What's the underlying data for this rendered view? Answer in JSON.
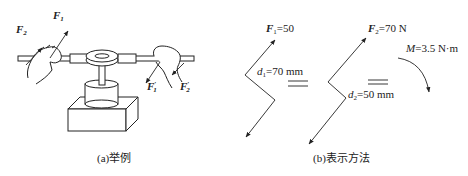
{
  "figure": {
    "panel_a": {
      "caption": "(a)举例",
      "labels": {
        "f1": "F",
        "f1_sub": "1",
        "f2": "F",
        "f2_sub": "2",
        "f1_prime": "F",
        "f1_prime_sub": "1",
        "f1_prime_mark": "′",
        "f2_prime": "F",
        "f2_prime_sub": "2",
        "f2_prime_mark": "′"
      }
    },
    "panel_b": {
      "caption": "(b)表示方法",
      "couple1": {
        "force_symbol": "F",
        "force_sub": "1",
        "force_value": "=50",
        "arm_symbol": "d",
        "arm_sub": "1",
        "arm_value": "=70 mm"
      },
      "couple2": {
        "force_symbol": "F",
        "force_sub": "2",
        "force_value": "=70 N",
        "arm_symbol": "d",
        "arm_sub": "2",
        "arm_value": "=50 mm"
      },
      "moment": {
        "symbol": "M",
        "value": "=3.5 N·m"
      },
      "equals_symbol": "="
    }
  },
  "colors": {
    "line": "#222222",
    "background": "#ffffff"
  }
}
